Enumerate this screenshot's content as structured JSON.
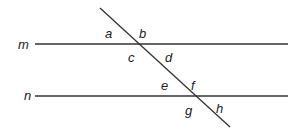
{
  "diagram": {
    "stroke_color": "#333333",
    "lines": [
      {
        "name": "m",
        "x1": 35,
        "y1": 44,
        "x2": 288,
        "y2": 44,
        "label_x": 18,
        "label_y": 49
      },
      {
        "name": "n",
        "x1": 35,
        "y1": 96,
        "x2": 288,
        "y2": 96,
        "label_x": 24,
        "label_y": 100
      }
    ],
    "transversal": {
      "x1": 100,
      "y1": 8,
      "x2": 230,
      "y2": 127
    },
    "angle_labels": [
      {
        "text": "a",
        "x": 105,
        "y": 38
      },
      {
        "text": "b",
        "x": 139,
        "y": 38
      },
      {
        "text": "c",
        "x": 128,
        "y": 62
      },
      {
        "text": "d",
        "x": 165,
        "y": 62
      },
      {
        "text": "e",
        "x": 161,
        "y": 90
      },
      {
        "text": "f",
        "x": 191,
        "y": 90
      },
      {
        "text": "g",
        "x": 185,
        "y": 115
      },
      {
        "text": "h",
        "x": 216,
        "y": 113
      }
    ]
  }
}
